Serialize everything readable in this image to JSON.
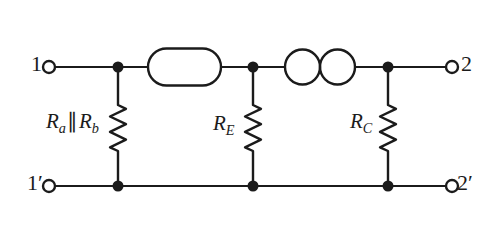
{
  "figure": {
    "type": "two-port-equivalent-circuit",
    "colors": {
      "ink": "#1b1b1b",
      "background": "#ffffff"
    },
    "terminals": {
      "t1": "1",
      "t1_prime": "1′",
      "t2": "2",
      "t2_prime": "2′"
    },
    "components": {
      "shunt_left": {
        "kind": "resistor-zigzag-icon",
        "label": {
          "r1": "R",
          "sub1": "a",
          "parallel": "∥",
          "r2": "R",
          "sub2": "b"
        }
      },
      "shunt_middle": {
        "kind": "resistor-zigzag-icon",
        "label": {
          "r": "R",
          "sub": "E"
        }
      },
      "shunt_right": {
        "kind": "resistor-zigzag-icon",
        "label": {
          "r": "R",
          "sub": "C"
        }
      },
      "series_box": {
        "kind": "stadium-outline-icon"
      },
      "series_source": {
        "kind": "double-circle-icon"
      }
    }
  }
}
